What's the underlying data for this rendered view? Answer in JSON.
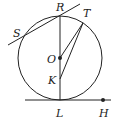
{
  "diagram": {
    "type": "geometry",
    "circle": {
      "center_label": "O",
      "cx": 60,
      "cy": 58,
      "r": 42
    },
    "points": [
      {
        "name": "R",
        "x": 60,
        "y": 16,
        "label_x": 56,
        "label_y": 11
      },
      {
        "name": "T",
        "x": 83,
        "y": 23,
        "label_x": 83,
        "label_y": 17
      },
      {
        "name": "S",
        "x": 23,
        "y": 36,
        "label_x": 13,
        "label_y": 37
      },
      {
        "name": "O",
        "x": 60,
        "y": 58,
        "label_x": 47,
        "label_y": 63
      },
      {
        "name": "K",
        "x": 60,
        "y": 79,
        "label_x": 48,
        "label_y": 84
      },
      {
        "name": "L",
        "x": 60,
        "y": 100,
        "label_x": 56,
        "label_y": 117
      },
      {
        "name": "H",
        "x": 103,
        "y": 100,
        "label_x": 99,
        "label_y": 117
      }
    ],
    "segments": [
      "RL",
      "OT",
      "KT"
    ],
    "lines": [
      {
        "name": "tangent-at-R-through-S",
        "x1": 8,
        "y1": 45,
        "x2": 80,
        "y2": 4
      },
      {
        "name": "tangent-at-L-through-H",
        "x1": 25,
        "y1": 100,
        "x2": 111,
        "y2": 100
      }
    ],
    "marked_points": [
      "O",
      "H"
    ],
    "stroke_color": "#222222"
  }
}
